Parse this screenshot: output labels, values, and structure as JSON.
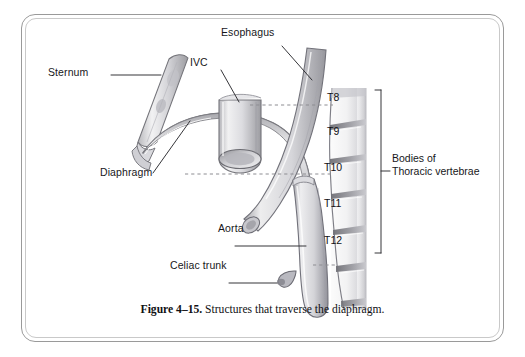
{
  "figure": {
    "caption_number": "Figure 4–15.",
    "caption_text": "Structures that traverse the diaphragm.",
    "colors": {
      "frame_outer": "#9a9a9a",
      "frame_inner": "#c9c9c9",
      "page_background": "#ffffff",
      "label_text": "#17171a",
      "line_art": "#6e6e72",
      "tissue_light": "#ececee",
      "tissue_mid": "#c9c9cd",
      "tissue_dark": "#8e8e94",
      "dashed_guide": "#8d8d92"
    }
  },
  "labels": {
    "sternum": "Sternum",
    "ivc": "IVC",
    "esophagus": "Esophagus",
    "diaphragm": "Diaphragm",
    "aorta": "Aorta",
    "celiac_trunk": "Celiac trunk",
    "bracket_line1": "Bodies of",
    "bracket_line2": "Thoracic vertebrae"
  },
  "vertebrae": [
    {
      "id": "T8",
      "label": "T8"
    },
    {
      "id": "T9",
      "label": "T9"
    },
    {
      "id": "T10",
      "label": "T10"
    },
    {
      "id": "T11",
      "label": "T11"
    },
    {
      "id": "T12",
      "label": "T12"
    }
  ]
}
